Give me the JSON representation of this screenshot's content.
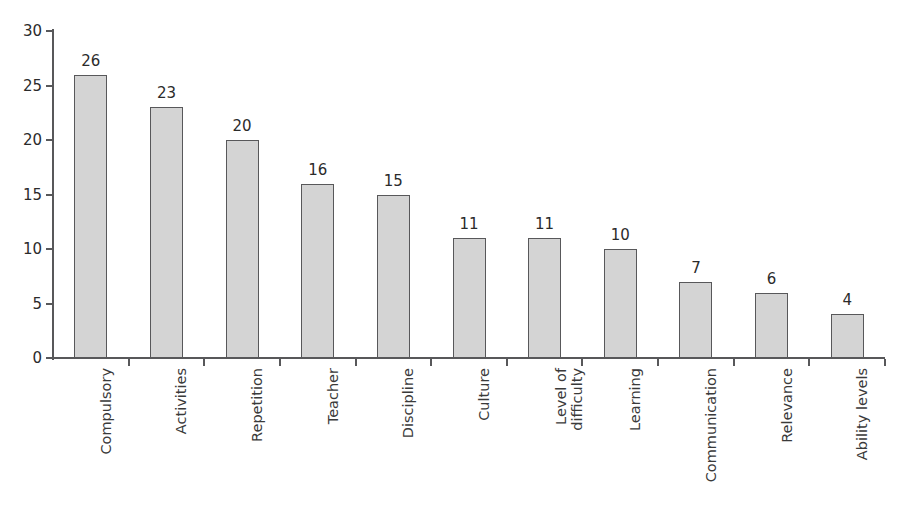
{
  "chart_data": {
    "type": "bar",
    "title": "",
    "subtitle": "",
    "xlabel": "",
    "ylabel": "",
    "ylim": [
      0,
      30
    ],
    "yticks": [
      0,
      5,
      10,
      15,
      20,
      25,
      30
    ],
    "grid": false,
    "legend": null,
    "orientation": "vertical",
    "bar_fill_color": "#d4d4d4",
    "bar_border_color": "#58585a",
    "axis_color": "#58585a",
    "background_color": "#ffffff",
    "label_rotation_degrees": -90,
    "categories": [
      "Compulsory",
      "Activities",
      "Repetition",
      "Teacher",
      "Discipline",
      "Culture",
      "Level of difficulty",
      "Learning",
      "Communication",
      "Relevance",
      "Ability levels"
    ],
    "category_label_lines": [
      [
        "Compulsory"
      ],
      [
        "Activities"
      ],
      [
        "Repetition"
      ],
      [
        "Teacher"
      ],
      [
        "Discipline"
      ],
      [
        "Culture"
      ],
      [
        "Level of",
        "difficulty"
      ],
      [
        "Learning"
      ],
      [
        "Communication"
      ],
      [
        "Relevance"
      ],
      [
        "Ability levels"
      ]
    ],
    "values": [
      26,
      23,
      20,
      16,
      15,
      11,
      11,
      10,
      7,
      6,
      4
    ],
    "data_labels": [
      "26",
      "23",
      "20",
      "16",
      "15",
      "11",
      "11",
      "10",
      "7",
      "6",
      "4"
    ],
    "ytick_labels": [
      "0",
      "5",
      "10",
      "15",
      "20",
      "25",
      "30"
    ]
  }
}
